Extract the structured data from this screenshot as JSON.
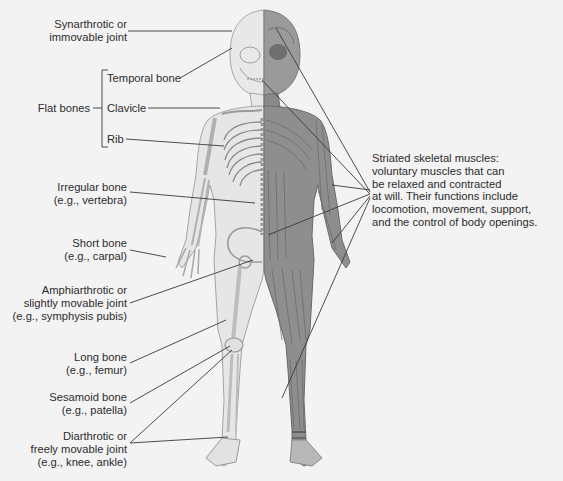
{
  "diagram": {
    "colors": {
      "background": "#f3f3f3",
      "skin_skeleton_side": "#e6e6e6",
      "bone_outline": "#9a9a9a",
      "muscle_fill": "#8c8c8c",
      "muscle_dark": "#6e6e6e",
      "leader_line": "#3a3a3a",
      "text": "#2c2c2c"
    },
    "labels_left": {
      "synarthrotic": {
        "line1": "Synarthrotic or",
        "line2": "immovable joint"
      },
      "flat_bones": {
        "group_label": "Flat bones",
        "items": [
          {
            "label": "Temporal bone"
          },
          {
            "label": "Clavicle"
          },
          {
            "label": "Rib"
          }
        ]
      },
      "irregular": {
        "line1": "Irregular bone",
        "line2": "(e.g., vertebra)"
      },
      "short": {
        "line1": "Short bone",
        "line2": "(e.g., carpal)"
      },
      "amphiarthrotic": {
        "line1": "Amphiarthrotic or",
        "line2": "slightly movable joint",
        "line3": "(e.g., symphysis pubis)"
      },
      "long": {
        "line1": "Long bone",
        "line2": "(e.g., femur)"
      },
      "sesamoid": {
        "line1": "Sesamoid bone",
        "line2": "(e.g., patella)"
      },
      "diarthrotic": {
        "line1": "Diarthrotic or",
        "line2": "freely movable joint",
        "line3": "(e.g., knee, ankle)"
      }
    },
    "labels_right": {
      "striated": {
        "line1": "Striated skeletal muscles:",
        "line2": "voluntary muscles that can",
        "line3": "be relaxed and contracted",
        "line4": "at will. Their functions include",
        "line5": "locomotion, movement, support,",
        "line6": "and the control of body openings."
      }
    }
  }
}
